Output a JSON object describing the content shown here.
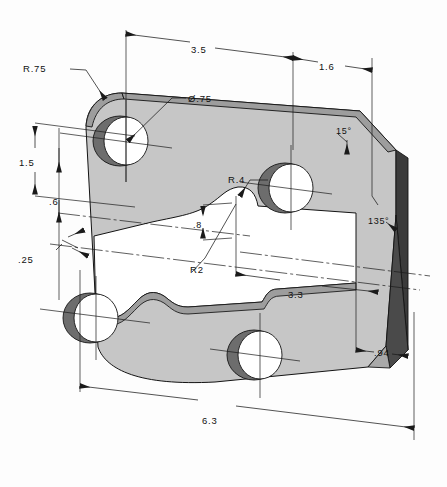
{
  "drawing": {
    "title": "Isometric pictorial drawing of dimensioned plate",
    "type": "engineering-pictorial",
    "units": "inches",
    "colors": {
      "paper": "#fdfdfd",
      "face_fill": "#c9c9c9",
      "top_bevel_fill": "#9a9a9a",
      "edge_dark_fill": "#3a3a3a",
      "hole_shadow": "#6f6f6f",
      "line": "#141414"
    },
    "dimensions": [
      {
        "id": "top-overall",
        "label": "3.5",
        "kind": "linear",
        "position": "top"
      },
      {
        "id": "top-right",
        "label": "1.6",
        "kind": "linear",
        "position": "top-right"
      },
      {
        "id": "corner-radius",
        "label": "R.75",
        "kind": "radius",
        "position": "top-left"
      },
      {
        "id": "hole-diameter",
        "label": "Ø.75",
        "kind": "diameter",
        "position": "top-center"
      },
      {
        "id": "left-upper",
        "label": "1.5",
        "kind": "linear",
        "position": "left"
      },
      {
        "id": "left-mid",
        "label": ".6",
        "kind": "linear",
        "position": "left"
      },
      {
        "id": "thickness",
        "label": ".25",
        "kind": "linear",
        "position": "left-lower"
      },
      {
        "id": "slot-radius",
        "label": "R.4",
        "kind": "radius",
        "position": "center"
      },
      {
        "id": "slot-offset",
        "label": ".8",
        "kind": "linear",
        "position": "center"
      },
      {
        "id": "step-radius",
        "label": "R2",
        "kind": "radius",
        "position": "center-left"
      },
      {
        "id": "slot-length",
        "label": "3.3",
        "kind": "linear",
        "position": "center-right"
      },
      {
        "id": "angle-top",
        "label": "15°",
        "kind": "angular",
        "position": "right-upper"
      },
      {
        "id": "angle-corner",
        "label": "135°",
        "kind": "angular",
        "position": "right"
      },
      {
        "id": "right-lower",
        "label": ".94",
        "kind": "linear",
        "position": "right-lower"
      },
      {
        "id": "bottom-overall",
        "label": "6.3",
        "kind": "linear",
        "position": "bottom"
      }
    ],
    "labels": {
      "top_overall": "3.5",
      "top_right": "1.6",
      "corner_radius": "R.75",
      "hole_diameter": "Ø.75",
      "left_upper": "1.5",
      "left_mid": ".6",
      "thickness": ".25",
      "slot_radius": "R.4",
      "slot_offset": ".8",
      "step_radius": "R2",
      "slot_length": "3.3",
      "angle_top": "15°",
      "angle_corner": "135°",
      "right_lower": ".94",
      "bottom_overall": "6.3"
    },
    "features": {
      "holes": [
        {
          "id": "hole-top-left",
          "diameter_label": "Ø.75"
        },
        {
          "id": "hole-top-right",
          "diameter_label": "Ø.75"
        },
        {
          "id": "hole-bottom-left",
          "diameter_label": "Ø.75"
        },
        {
          "id": "hole-bottom-right",
          "diameter_label": "Ø.75"
        }
      ],
      "cutout": {
        "id": "center-slot",
        "radius_label": "R.4",
        "fillet_label": "R2"
      }
    }
  }
}
